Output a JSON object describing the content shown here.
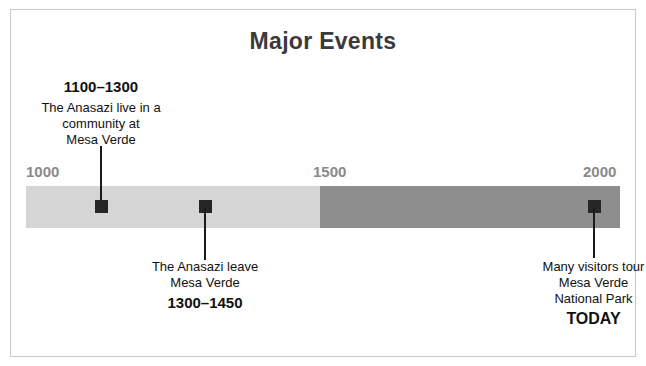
{
  "title": "Major Events",
  "chart_data": {
    "type": "timeline",
    "title": "Major Events",
    "xlabel": "",
    "ylabel": "",
    "axis_range": [
      1000,
      2000
    ],
    "tick_labels": [
      "1000",
      "1500",
      "2000"
    ],
    "ticks": [
      1000,
      1500,
      2000
    ],
    "grid": false,
    "legend": "none",
    "segments": [
      {
        "name": "1000-1500",
        "start": 1000,
        "end": 1500,
        "color": "#d5d5d5"
      },
      {
        "name": "1500-2000",
        "start": 1500,
        "end": 2000,
        "color": "#8e8e8e"
      }
    ],
    "events": [
      {
        "range": "1100–1300",
        "start": 1100,
        "end": 1300,
        "description_lines": [
          "The Anasazi live in a",
          "community at",
          "Mesa Verde"
        ],
        "marker_position": 1125,
        "label_side": "above"
      },
      {
        "range": "1300–1450",
        "start": 1300,
        "end": 1450,
        "description_lines": [
          "The Anasazi leave",
          "Mesa Verde"
        ],
        "marker_position": 1300,
        "label_side": "below"
      },
      {
        "range": "TODAY",
        "start": 2000,
        "end": 2000,
        "description_lines": [
          "Many visitors tour",
          "Mesa Verde",
          "National Park"
        ],
        "marker_position": 1955,
        "label_side": "below"
      }
    ]
  },
  "ticks": {
    "start": "1000",
    "middle": "1500",
    "end": "2000"
  },
  "events": {
    "first": {
      "range": "1100–1300",
      "line1": "The Anasazi live in a",
      "line2": "community at",
      "line3": "Mesa Verde"
    },
    "second": {
      "range": "1300–1450",
      "line1": "The Anasazi leave",
      "line2": "Mesa Verde"
    },
    "third": {
      "range": "TODAY",
      "line1": "Many visitors tour",
      "line2": "Mesa Verde",
      "line3": "National Park"
    }
  },
  "colors": {
    "segment_early": "#d5d5d5",
    "segment_late": "#8e8e8e",
    "marker": "#262626",
    "tick_text": "#8a8a8a",
    "title_text": "#3a3a3a",
    "frame": "#c9c9c9"
  }
}
